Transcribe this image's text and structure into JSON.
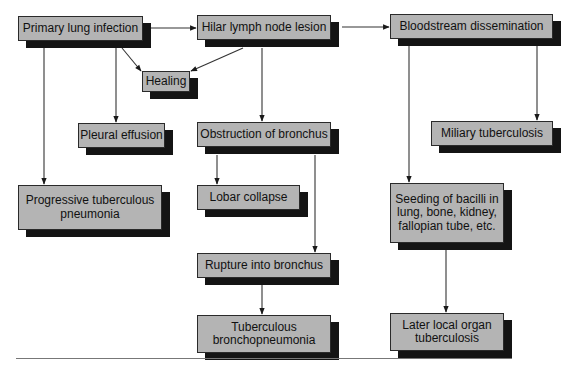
{
  "diagram": {
    "title": "",
    "nodes": [
      {
        "id": "primary",
        "label": "Primary lung infection",
        "x": 18,
        "y": 16,
        "w": 125,
        "h": 25
      },
      {
        "id": "hilar",
        "label": "Hilar lymph node lesion",
        "x": 197,
        "y": 15,
        "w": 134,
        "h": 25
      },
      {
        "id": "blood",
        "label": "Bloodstream dissemination",
        "x": 390,
        "y": 14,
        "w": 163,
        "h": 25
      },
      {
        "id": "healing",
        "label": "Healing",
        "x": 142,
        "y": 71,
        "w": 48,
        "h": 21
      },
      {
        "id": "pleural",
        "label": "Pleural effusion",
        "x": 78,
        "y": 123,
        "w": 87,
        "h": 25
      },
      {
        "id": "obstruction",
        "label": "Obstruction of bronchus",
        "x": 197,
        "y": 122,
        "w": 134,
        "h": 25
      },
      {
        "id": "miliary",
        "label": "Miliary tuberculosis",
        "x": 431,
        "y": 121,
        "w": 122,
        "h": 25
      },
      {
        "id": "progressive",
        "label": "Progressive tuberculous\npneumonia",
        "x": 18,
        "y": 185,
        "w": 144,
        "h": 45
      },
      {
        "id": "lobar",
        "label": "Lobar collapse",
        "x": 197,
        "y": 185,
        "w": 103,
        "h": 25
      },
      {
        "id": "seeding",
        "label": "Seeding of bacilli in\nlung, bone, kidney,\nfallopian tube, etc.",
        "x": 390,
        "y": 183,
        "w": 114,
        "h": 60
      },
      {
        "id": "rupture",
        "label": "Rupture into bronchus",
        "x": 197,
        "y": 253,
        "w": 134,
        "h": 25
      },
      {
        "id": "tbbronch",
        "label": "Tuberculous\nbronchopneumonia",
        "x": 197,
        "y": 315,
        "w": 134,
        "h": 38
      },
      {
        "id": "later",
        "label": "Later local organ\ntuberculosis",
        "x": 390,
        "y": 313,
        "w": 114,
        "h": 38
      }
    ],
    "edges": [
      {
        "from": "primary",
        "to": "hilar",
        "points": [
          [
            151,
            28
          ],
          [
            196,
            28
          ]
        ]
      },
      {
        "from": "hilar",
        "to": "blood",
        "points": [
          [
            342,
            27
          ],
          [
            389,
            27
          ]
        ]
      },
      {
        "from": "primary",
        "to": "healing",
        "points": [
          [
            122,
            48
          ],
          [
            141,
            71
          ]
        ]
      },
      {
        "from": "hilar",
        "to": "healing",
        "points": [
          [
            243,
            48
          ],
          [
            191,
            71
          ]
        ]
      },
      {
        "from": "primary",
        "to": "pleural",
        "points": [
          [
            116,
            48
          ],
          [
            116,
            122
          ]
        ]
      },
      {
        "from": "primary",
        "to": "progressive",
        "points": [
          [
            44,
            48
          ],
          [
            44,
            184
          ]
        ]
      },
      {
        "from": "hilar",
        "to": "obstruction",
        "points": [
          [
            262,
            48
          ],
          [
            262,
            121
          ]
        ]
      },
      {
        "from": "blood",
        "to": "miliary",
        "points": [
          [
            537,
            46
          ],
          [
            537,
            120
          ]
        ]
      },
      {
        "from": "blood",
        "to": "seeding",
        "points": [
          [
            409,
            46
          ],
          [
            409,
            182
          ]
        ]
      },
      {
        "from": "obstruction",
        "to": "lobar",
        "points": [
          [
            217,
            155
          ],
          [
            217,
            184
          ]
        ]
      },
      {
        "from": "obstruction",
        "to": "rupture",
        "points": [
          [
            315,
            155
          ],
          [
            315,
            252
          ]
        ]
      },
      {
        "from": "rupture",
        "to": "tbbronch",
        "points": [
          [
            262,
            285
          ],
          [
            262,
            314
          ]
        ]
      },
      {
        "from": "seeding",
        "to": "later",
        "points": [
          [
            446,
            250
          ],
          [
            446,
            312
          ]
        ]
      }
    ]
  }
}
